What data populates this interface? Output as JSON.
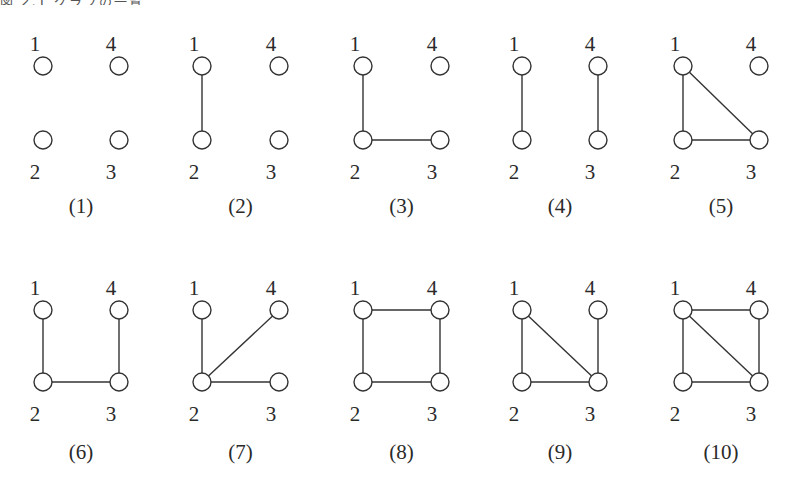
{
  "header": {
    "cut_off_text": "図 2.1 グラフの一覧"
  },
  "style": {
    "stroke_color": "#333333",
    "text_color": "#2a2a2a",
    "background": "#ffffff",
    "node_radius": 9
  },
  "layout": {
    "columns_x": [
      {
        "left": 43,
        "right": 119
      },
      {
        "left": 202,
        "right": 279
      },
      {
        "left": 363,
        "right": 440
      },
      {
        "left": 522,
        "right": 598
      },
      {
        "left": 683,
        "right": 759
      }
    ],
    "rows_y": [
      {
        "top": 66,
        "bottom": 140,
        "top_label": 44,
        "bottom_label": 172,
        "caption": 206
      },
      {
        "top": 310,
        "bottom": 382,
        "top_label": 288,
        "bottom_label": 414,
        "caption": 452
      }
    ]
  },
  "node_positions": {
    "1": "top-left",
    "4": "top-right",
    "2": "bottom-left",
    "3": "bottom-right"
  },
  "graphs": [
    {
      "id": 1,
      "caption": "(1)",
      "nodes": [
        "1",
        "2",
        "3",
        "4"
      ],
      "edges": []
    },
    {
      "id": 2,
      "caption": "(2)",
      "nodes": [
        "1",
        "2",
        "3",
        "4"
      ],
      "edges": [
        [
          "1",
          "2"
        ]
      ]
    },
    {
      "id": 3,
      "caption": "(3)",
      "nodes": [
        "1",
        "2",
        "3",
        "4"
      ],
      "edges": [
        [
          "1",
          "2"
        ],
        [
          "2",
          "3"
        ]
      ]
    },
    {
      "id": 4,
      "caption": "(4)",
      "nodes": [
        "1",
        "2",
        "3",
        "4"
      ],
      "edges": [
        [
          "1",
          "2"
        ],
        [
          "4",
          "3"
        ]
      ]
    },
    {
      "id": 5,
      "caption": "(5)",
      "nodes": [
        "1",
        "2",
        "3",
        "4"
      ],
      "edges": [
        [
          "1",
          "2"
        ],
        [
          "2",
          "3"
        ],
        [
          "1",
          "3"
        ]
      ]
    },
    {
      "id": 6,
      "caption": "(6)",
      "nodes": [
        "1",
        "2",
        "3",
        "4"
      ],
      "edges": [
        [
          "1",
          "2"
        ],
        [
          "2",
          "3"
        ],
        [
          "4",
          "3"
        ]
      ]
    },
    {
      "id": 7,
      "caption": "(7)",
      "nodes": [
        "1",
        "2",
        "3",
        "4"
      ],
      "edges": [
        [
          "1",
          "2"
        ],
        [
          "2",
          "4"
        ],
        [
          "2",
          "3"
        ]
      ]
    },
    {
      "id": 8,
      "caption": "(8)",
      "nodes": [
        "1",
        "2",
        "3",
        "4"
      ],
      "edges": [
        [
          "1",
          "4"
        ],
        [
          "4",
          "3"
        ],
        [
          "3",
          "2"
        ],
        [
          "2",
          "1"
        ]
      ]
    },
    {
      "id": 9,
      "caption": "(9)",
      "nodes": [
        "1",
        "2",
        "3",
        "4"
      ],
      "edges": [
        [
          "1",
          "2"
        ],
        [
          "1",
          "3"
        ],
        [
          "2",
          "3"
        ],
        [
          "4",
          "3"
        ]
      ]
    },
    {
      "id": 10,
      "caption": "(10)",
      "nodes": [
        "1",
        "2",
        "3",
        "4"
      ],
      "edges": [
        [
          "1",
          "4"
        ],
        [
          "1",
          "2"
        ],
        [
          "1",
          "3"
        ],
        [
          "2",
          "3"
        ],
        [
          "4",
          "3"
        ]
      ]
    }
  ]
}
